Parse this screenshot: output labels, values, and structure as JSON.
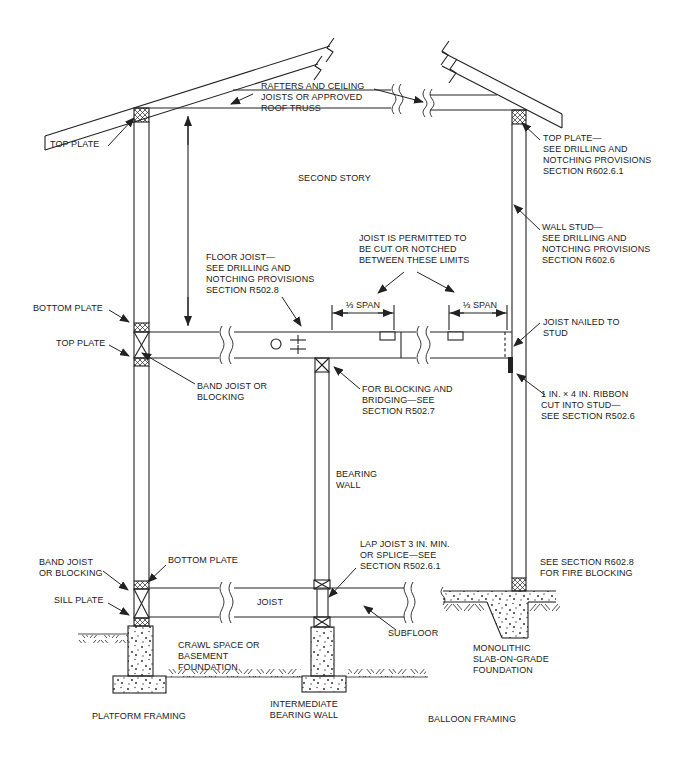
{
  "figure": {
    "labels": {
      "rafters": "RAFTERS AND CEILING\nJOISTS OR APPROVED\nROOF TRUSS",
      "top_plate_left": "TOP PLATE",
      "top_plate_right": "TOP PLATE—\nSEE DRILLING AND\nNOTCHING PROVISIONS\nSECTION R602.6.1",
      "second_story": "SECOND STORY",
      "wall_stud": "WALL STUD—\nSEE DRILLING AND\nNOTCHING PROVISIONS\nSECTION R602.6",
      "floor_joist": "FLOOR JOIST—\nSEE DRILLING AND\nNOTCHING PROVISIONS\nSECTION R502.8",
      "joist_cut": "JOIST IS PERMITTED TO\nBE CUT OR NOTCHED\nBETWEEN THESE LIMITS",
      "span_left": "⅓ SPAN",
      "span_right": "⅓ SPAN",
      "bottom_plate_upper": "BOTTOM PLATE",
      "top_plate_mid": "TOP PLATE",
      "band_joist_upper": "BAND JOIST OR\nBLOCKING",
      "blocking_bridging": "FOR BLOCKING AND\nBRIDGING—SEE\nSECTION R502.7",
      "joist_nailed": "JOIST NAILED TO\nSTUD",
      "ribbon": "1 IN. × 4 IN. RIBBON\nCUT INTO STUD—\nSEE SECTION R502.6",
      "bearing_wall": "BEARING\nWALL",
      "lap_joist": "LAP JOIST 3 IN. MIN.\nOR SPLICE—SEE\nSECTION R502.6.1",
      "band_joist_lower": "BAND JOIST\nOR BLOCKING",
      "bottom_plate_lower": "BOTTOM PLATE",
      "sill_plate": "SILL PLATE",
      "joist": "JOIST",
      "crawl_space": "CRAWL SPACE OR\nBASEMENT\nFOUNDATION",
      "subfloor": "SUBFLOOR",
      "fire_blocking": "SEE SECTION R602.8\nFOR FIRE BLOCKING",
      "monolithic": "MONOLITHIC\nSLAB-ON-GRADE\nFOUNDATION",
      "platform_framing": "PLATFORM FRAMING",
      "intermediate_bearing_wall": "INTERMEDIATE\nBEARING WALL",
      "balloon_framing": "BALLOON FRAMING"
    },
    "colors": {
      "line": "#222222",
      "text": "#222222",
      "background": "#ffffff"
    }
  }
}
